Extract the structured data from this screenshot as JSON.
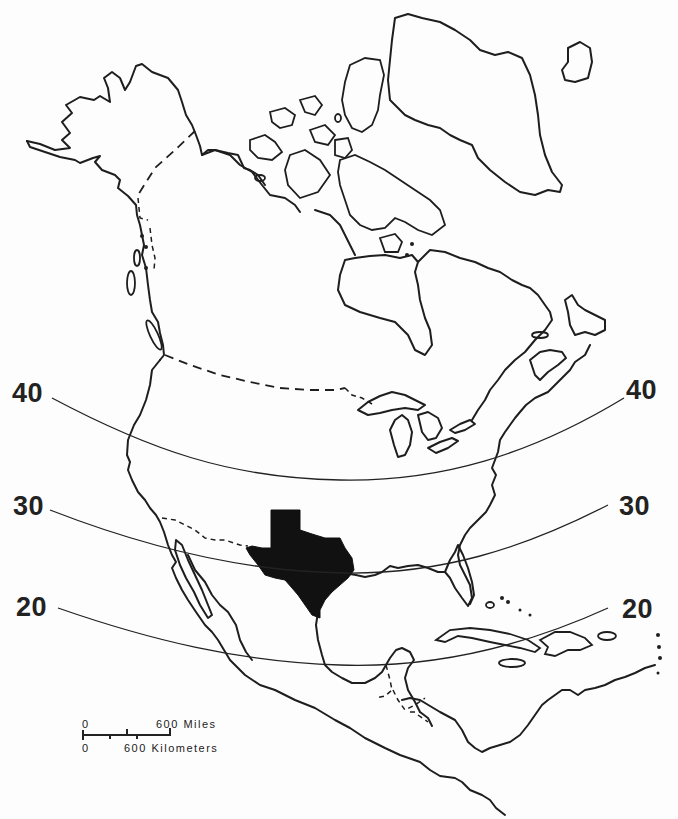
{
  "map": {
    "title": "North America with Texas highlighted",
    "highlighted_region": "Texas",
    "highlight_color": "#111111",
    "outline_color": "#1e1e1e",
    "background_color": "#fdfdfd"
  },
  "parallels": [
    {
      "value": "40",
      "left_label": "40",
      "right_label": "40"
    },
    {
      "value": "30",
      "left_label": "30",
      "right_label": "30"
    },
    {
      "value": "20",
      "left_label": "20",
      "right_label": "20"
    }
  ],
  "scale_bar": {
    "miles_zero": "0",
    "miles_label": "600 Miles",
    "km_zero": "0",
    "km_label": "600 Kilometers"
  }
}
